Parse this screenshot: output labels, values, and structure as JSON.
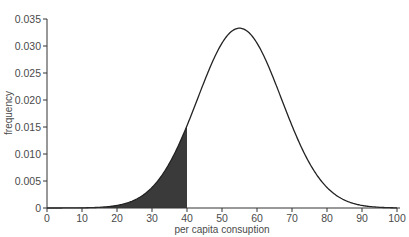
{
  "chart_data": {
    "type": "area",
    "title": "",
    "xlabel": "per capita consuption",
    "ylabel": "frequency",
    "xlim": [
      0,
      100
    ],
    "ylim": [
      0,
      0.035
    ],
    "x_ticks": [
      0,
      10,
      20,
      30,
      40,
      50,
      60,
      70,
      80,
      90,
      100
    ],
    "y_ticks": [
      0,
      0.005,
      0.01,
      0.015,
      0.02,
      0.025,
      0.03,
      0.035
    ],
    "y_tick_labels": [
      "0",
      "0.005",
      "0.010",
      "0.015",
      "0.020",
      "0.025",
      "0.030",
      "0.035"
    ],
    "x_tick_labels": [
      "0",
      "10",
      "20",
      "30",
      "40",
      "50",
      "60",
      "70",
      "80",
      "90",
      "100"
    ],
    "grid": false,
    "legend": null,
    "series": [
      {
        "name": "normal density",
        "distribution": "normal",
        "mean": 55,
        "sd": 12,
        "peak": 0.0333,
        "x": [
          0,
          10,
          15,
          20,
          25,
          30,
          35,
          40,
          45,
          50,
          55,
          60,
          65,
          70,
          75,
          80,
          85,
          90,
          95,
          100
        ],
        "values": [
          0.0001,
          0.0002,
          0.0007,
          0.0013,
          0.0026,
          0.0038,
          0.0083,
          0.0153,
          0.0235,
          0.0306,
          0.0333,
          0.0306,
          0.0235,
          0.0153,
          0.0083,
          0.0038,
          0.0013,
          0.0005,
          0.0001,
          0.0
        ],
        "color": "#222222"
      }
    ],
    "shaded_region": {
      "from": 0,
      "to": 40,
      "color": "#3a3a3a",
      "value_at_cutoff": 0.015
    }
  }
}
